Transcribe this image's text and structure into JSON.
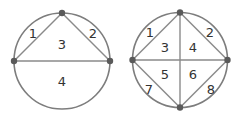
{
  "colors": {
    "stroke": "#7d7d7d",
    "point": "#5a5a5a",
    "text": "#333333"
  },
  "diagram_left": {
    "description": "Circle with 3 points, chords forming triangle and diameter",
    "regions": [
      {
        "label": "1",
        "x": 33,
        "y": 33
      },
      {
        "label": "2",
        "x": 93,
        "y": 33
      },
      {
        "label": "3",
        "x": 62,
        "y": 44
      },
      {
        "label": "4",
        "x": 62,
        "y": 80
      }
    ]
  },
  "diagram_right": {
    "description": "Circle with 4 points, all chords drawn forming 8 regions",
    "regions": [
      {
        "label": "1",
        "x": 150,
        "y": 32
      },
      {
        "label": "2",
        "x": 210,
        "y": 32
      },
      {
        "label": "3",
        "x": 165,
        "y": 47
      },
      {
        "label": "4",
        "x": 193,
        "y": 47
      },
      {
        "label": "5",
        "x": 165,
        "y": 74
      },
      {
        "label": "6",
        "x": 193,
        "y": 74
      },
      {
        "label": "7",
        "x": 149,
        "y": 89
      },
      {
        "label": "8",
        "x": 211,
        "y": 89
      }
    ]
  }
}
